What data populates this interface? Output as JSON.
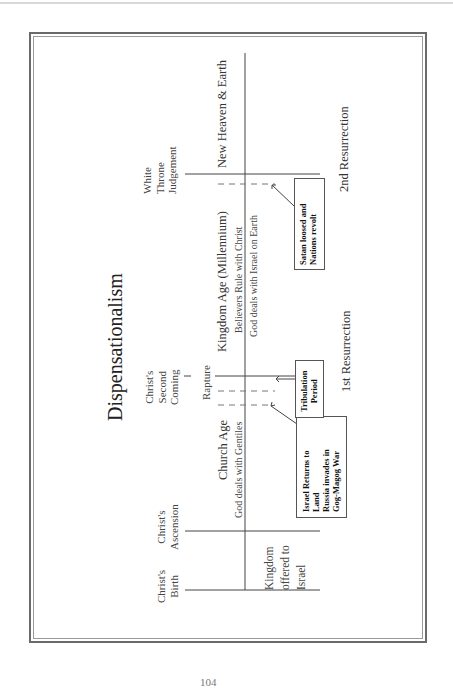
{
  "title": "Dispensationalism",
  "events": {
    "christs_birth": "Christ's\nBirth",
    "christs_ascension": "Christ's\nAscension",
    "christs_second_coming": "Christ's\nSecond\nComing",
    "rapture": "Rapture",
    "white_throne_judgement": "White\nThrone\nJudgement"
  },
  "ages": {
    "kingdom_offered": "Kingdom\noffered to\nIsrael",
    "church_age": {
      "label": "Church Age",
      "sub": "God deals with Gentiles"
    },
    "kingdom_age": {
      "label": "Kingdom Age (Millennium)",
      "sub1": "Believers Rule with Christ",
      "sub2": "God deals with Israel on Earth"
    },
    "new_heaven": "New Heaven & Earth"
  },
  "boxes": {
    "israel_returns": "Israel Returns to\nLand\nRussia invades in\nGog-Magog War",
    "tribulation": "Tribulation\nPeriod",
    "satan_loosed": "Satan loosed and\nNations revolt"
  },
  "resurrections": {
    "first": "1st Resurrection",
    "second": "2nd Resurrection"
  },
  "page_number": "104"
}
